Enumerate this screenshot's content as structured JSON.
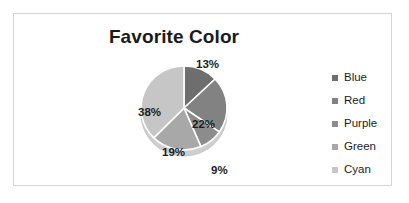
{
  "chart_data": {
    "type": "pie",
    "title": "Favorite Color",
    "categories": [
      "Blue",
      "Red",
      "Purple",
      "Green",
      "Cyan"
    ],
    "values": [
      13,
      22,
      9,
      19,
      38
    ],
    "value_labels": [
      "13%",
      "22%",
      "9%",
      "19%",
      "38%"
    ],
    "colors": [
      "#6e6e6e",
      "#828282",
      "#8c8c8c",
      "#a8a8a8",
      "#c6c6c6"
    ],
    "legend_position": "right",
    "grid": false,
    "start_angle_deg": 0,
    "direction": "clockwise",
    "xlabel": "",
    "ylabel": ""
  },
  "chart": {
    "title": "Favorite Color",
    "slices": [
      {
        "name": "Blue",
        "label": "13%",
        "color": "#6e6e6e",
        "value": 13,
        "label_left": 82,
        "label_top": 2,
        "label_inside": false
      },
      {
        "name": "Red",
        "label": "22%",
        "color": "#828282",
        "value": 22,
        "label_left": 78,
        "label_top": 62,
        "label_inside": true
      },
      {
        "name": "Purple",
        "label": "9%",
        "color": "#8c8c8c",
        "value": 9,
        "label_left": 97,
        "label_top": 108,
        "label_inside": false
      },
      {
        "name": "Green",
        "label": "19%",
        "color": "#a8a8a8",
        "value": 19,
        "label_left": 48,
        "label_top": 90,
        "label_inside": true
      },
      {
        "name": "Cyan",
        "label": "38%",
        "color": "#c6c6c6",
        "value": 38,
        "label_left": 24,
        "label_top": 50,
        "label_inside": true
      }
    ],
    "legend": [
      {
        "label": "Blue",
        "color": "#6e6e6e"
      },
      {
        "label": "Red",
        "color": "#828282"
      },
      {
        "label": "Purple",
        "color": "#8c8c8c"
      },
      {
        "label": "Green",
        "color": "#a8a8a8"
      },
      {
        "label": "Cyan",
        "color": "#c6c6c6"
      }
    ],
    "geometry": {
      "cx": 70,
      "cy": 52,
      "rx": 43,
      "ry": 42,
      "depth": 6
    },
    "border_color": "#d4d4d4",
    "background": "#ffffff"
  }
}
